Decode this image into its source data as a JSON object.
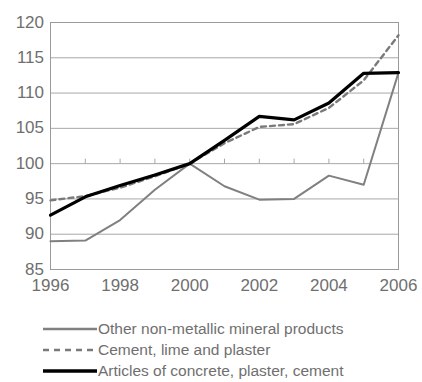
{
  "chart_data": {
    "type": "line",
    "title": "",
    "subtitle": "",
    "xlabel": "",
    "ylabel": "",
    "x": [
      1996,
      1997,
      1998,
      1999,
      2000,
      2001,
      2002,
      2003,
      2004,
      2005,
      2006
    ],
    "xlim": [
      1996,
      2006
    ],
    "ylim": [
      85,
      120
    ],
    "ytick_labels": [
      "120",
      "115",
      "110",
      "105",
      "100",
      "95",
      "90",
      "85"
    ],
    "ytick_values": [
      120,
      115,
      110,
      105,
      100,
      95,
      90,
      85
    ],
    "xtick_labels": [
      "1996",
      "1998",
      "2000",
      "2002",
      "2004",
      "2006"
    ],
    "xtick_values": [
      1996,
      1998,
      2000,
      2002,
      2004,
      2006
    ],
    "grid": true,
    "grid_axis": "y",
    "legend_position": "bottom",
    "series": [
      {
        "name": "Other non-metallic mineral products",
        "style": "solid",
        "color": "#808080",
        "width": 2,
        "values": [
          89.0,
          89.1,
          92.0,
          96.3,
          100.0,
          96.8,
          94.9,
          95.0,
          98.3,
          97.0,
          112.9
        ]
      },
      {
        "name": "Cement, lime and plaster",
        "style": "dashed",
        "color": "#7a7a7a",
        "width": 2.4,
        "values": [
          94.8,
          95.4,
          96.6,
          98.2,
          100.0,
          102.9,
          105.2,
          105.6,
          107.9,
          111.8,
          118.2
        ]
      },
      {
        "name": "Articles of concrete, plaster, cement",
        "style": "solid",
        "color": "#000000",
        "width": 3.2,
        "values": [
          92.7,
          95.3,
          96.9,
          98.4,
          100.0,
          103.3,
          106.7,
          106.2,
          108.6,
          112.8,
          112.9
        ]
      }
    ]
  },
  "legend": {
    "items": [
      {
        "label": "Other non-metallic mineral products",
        "swatch": "gray-solid-line-icon"
      },
      {
        "label": "Cement, lime and plaster",
        "swatch": "gray-dashed-line-icon"
      },
      {
        "label": "Articles of concrete, plaster, cement",
        "swatch": "black-solid-line-icon"
      }
    ]
  }
}
